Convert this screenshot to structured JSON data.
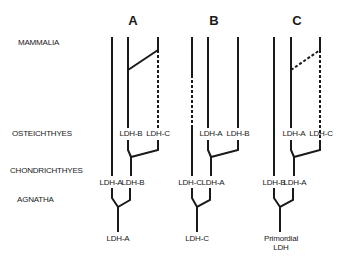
{
  "taxa": {
    "mammalia": "MAMMALIA",
    "osteichthyes": "OSTEICHTHYES",
    "chondrichthyes": "CHONDRICHTHYES",
    "agnatha": "AGNATHA"
  },
  "trees": [
    {
      "title": "A",
      "root": "LDH-A",
      "mid_left": "LDH-A",
      "mid_right": "LDH-B",
      "upper_left": "LDH-B",
      "upper_right": "LDH-C"
    },
    {
      "title": "B",
      "root": "LDH-C",
      "mid_left": "LDH-C",
      "mid_right": "LDH-A",
      "upper_left": "LDH-A",
      "upper_right": "LDH-B"
    },
    {
      "title": "C",
      "root_line1": "Primordial",
      "root_line2": "LDH",
      "mid_left": "LDH-B",
      "mid_right": "LDH-A",
      "upper_left": "LDH-A",
      "upper_right": "LDH-C"
    }
  ],
  "colors": {
    "line": "#1a1a1a",
    "background": "#ffffff"
  }
}
